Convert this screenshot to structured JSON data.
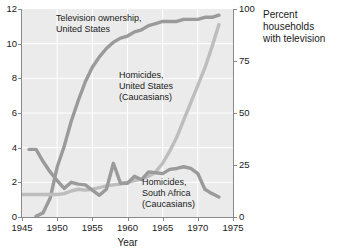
{
  "axes": {
    "x": {
      "label": "Year",
      "ticks": [
        "1945",
        "1950",
        "1955",
        "1960",
        "1965",
        "1970",
        "1975"
      ],
      "min": 1945,
      "max": 1975
    },
    "y_left": {
      "label": "",
      "ticks": [
        "0",
        "2",
        "4",
        "6",
        "8",
        "10",
        "12"
      ],
      "min": 0,
      "max": 12
    },
    "y_right": {
      "label": "Percent households with television",
      "label_line1": "Percent households",
      "label_line2": "with television",
      "ticks": [
        "0",
        "25",
        "50",
        "75",
        "100"
      ],
      "min": 0,
      "max": 100
    }
  },
  "annotations": {
    "tv": "Television ownership,\nUnited States",
    "us_homicides": "Homicides,\nUnited States\n(Caucasians)",
    "sa_homicides": "Homicides,\nSouth Africa\n(Caucasians)"
  },
  "colors": {
    "plot_background": "#ebebeb",
    "gridline": "#ffffff",
    "axis": "#8a8a8a",
    "series_tv": "#9a9a9a",
    "series_us_homicides": "#bdbdbd",
    "series_sa_homicides": "#9a9a9a",
    "text": "#1a1a1a"
  },
  "chart_data": {
    "type": "line",
    "title": "",
    "xlabel": "Year",
    "ylabel": "",
    "ylabel_right": "Percent households with television",
    "xlim": [
      1945,
      1975
    ],
    "ylim": [
      0,
      12
    ],
    "ylim_right": [
      0,
      100
    ],
    "grid": true,
    "legend": "annotations-inline",
    "series": [
      {
        "name": "Television ownership, United States",
        "axis": "right",
        "unit": "percent of households",
        "color": "#9a9a9a",
        "x": [
          1947,
          1948,
          1949,
          1950,
          1951,
          1952,
          1953,
          1954,
          1955,
          1956,
          1957,
          1958,
          1959,
          1960,
          1961,
          1962,
          1963,
          1964,
          1965,
          1966,
          1967,
          1968,
          1969,
          1970,
          1971,
          1972,
          1973
        ],
        "values": [
          0.4,
          2,
          9,
          24,
          34,
          46,
          56,
          65,
          72,
          77,
          81,
          84,
          86,
          87,
          89,
          90,
          92,
          93,
          94,
          94,
          94,
          95,
          95,
          95,
          96,
          96,
          97
        ]
      },
      {
        "name": "Homicides, United States (Caucasians)",
        "axis": "left",
        "unit": "per 100,000",
        "color": "#bdbdbd",
        "x": [
          1945,
          1946,
          1947,
          1948,
          1949,
          1950,
          1951,
          1952,
          1953,
          1954,
          1955,
          1956,
          1957,
          1958,
          1959,
          1960,
          1961,
          1962,
          1963,
          1964,
          1965,
          1966,
          1967,
          1968,
          1969,
          1970,
          1971,
          1972,
          1973
        ],
        "values": [
          1.3,
          1.3,
          1.3,
          1.3,
          1.3,
          1.3,
          1.35,
          1.5,
          1.6,
          1.55,
          1.6,
          1.7,
          1.8,
          1.85,
          1.9,
          2.0,
          2.1,
          2.2,
          2.35,
          2.6,
          3.1,
          3.8,
          4.6,
          5.6,
          6.6,
          7.6,
          8.6,
          9.8,
          11.1
        ]
      },
      {
        "name": "Homicides, South Africa (Caucasians)",
        "axis": "left",
        "unit": "per 100,000",
        "color": "#9a9a9a",
        "x": [
          1946,
          1947,
          1948,
          1949,
          1950,
          1951,
          1952,
          1953,
          1954,
          1955,
          1956,
          1957,
          1958,
          1959,
          1960,
          1961,
          1962,
          1963,
          1964,
          1965,
          1966,
          1967,
          1968,
          1969,
          1970,
          1971,
          1972,
          1973
        ],
        "values": [
          3.9,
          3.9,
          3.2,
          2.6,
          2.1,
          1.65,
          2.0,
          1.9,
          1.85,
          1.55,
          1.25,
          1.6,
          3.1,
          1.95,
          1.95,
          2.35,
          2.15,
          2.6,
          2.55,
          2.5,
          2.75,
          2.8,
          2.9,
          2.8,
          2.5,
          1.6,
          1.35,
          1.15
        ]
      }
    ]
  }
}
